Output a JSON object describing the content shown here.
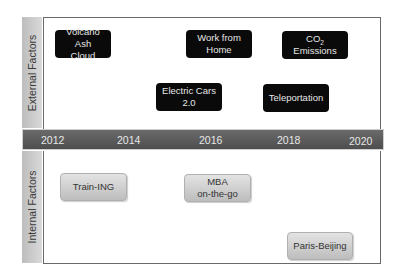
{
  "diagram": {
    "type": "timeline-roadmap",
    "sections": {
      "external": {
        "label": "External Factors"
      },
      "internal": {
        "label": "Internal Factors"
      }
    },
    "timeline": {
      "years": [
        "2012",
        "2014",
        "2016",
        "2018",
        "2020"
      ],
      "color": "#555555"
    },
    "external_items": [
      {
        "line1": "Volcano Ash",
        "line2": "Cloud",
        "year_approx": 2012.5
      },
      {
        "line1": "Work from",
        "line2": "Home",
        "year_approx": 2016.2
      },
      {
        "line1_prefix": "CO",
        "line1_sub": "2",
        "line2": "Emissions",
        "year_approx": 2018.8
      },
      {
        "line1": "Electric Cars",
        "line2": "2.0",
        "year_approx": 2015.7
      },
      {
        "line1": "Teleportation",
        "line2": "",
        "year_approx": 2018.1
      }
    ],
    "internal_items": [
      {
        "line1": "Train-ING",
        "line2": "",
        "year_approx": 2012.8
      },
      {
        "line1": "MBA",
        "line2": "on-the-go",
        "year_approx": 2016.1
      },
      {
        "line1": "Paris-Beijing",
        "line2": "",
        "year_approx": 2019.0
      }
    ],
    "colors": {
      "external_box": "#0a0a0a",
      "internal_box": "#cfcfcf",
      "side_label": "#cccccc"
    }
  }
}
